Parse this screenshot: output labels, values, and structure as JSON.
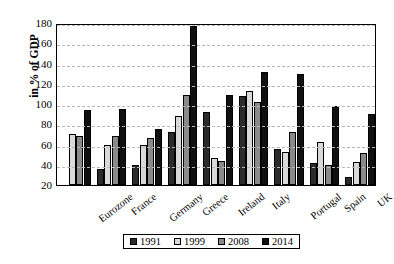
{
  "chart_data": {
    "type": "bar",
    "title": "",
    "xlabel": "",
    "ylabel": "in % of GDP",
    "ylim": [
      20,
      180
    ],
    "ytick_step": 20,
    "yticks": [
      180,
      160,
      140,
      120,
      100,
      80,
      60,
      40,
      20
    ],
    "grid": true,
    "legend_position": "bottom",
    "categories": [
      "Eurozone",
      "France",
      "Germany",
      "Greece",
      "Ireland",
      "Italy",
      "Portugal",
      "Spain",
      "UK"
    ],
    "series": [
      {
        "name": "1991",
        "color": "#2b2b2b",
        "values": [
          null,
          36,
          40,
          72,
          92,
          108,
          56,
          42,
          28
        ]
      },
      {
        "name": "1999",
        "color": "#d9d9d9",
        "values": [
          70,
          60,
          60,
          88,
          47,
          113,
          53,
          62,
          43
        ]
      },
      {
        "name": "2008",
        "color": "#8a8a8a",
        "values": [
          68,
          68,
          66,
          109,
          44,
          102,
          72,
          40,
          52
        ]
      },
      {
        "name": "2014",
        "color": "#101010",
        "values": [
          94,
          95,
          75,
          177,
          109,
          132,
          130,
          98,
          90
        ]
      }
    ]
  },
  "legend": {
    "items": [
      {
        "label": "1991"
      },
      {
        "label": "1999"
      },
      {
        "label": "2008"
      },
      {
        "label": "2014"
      }
    ]
  }
}
